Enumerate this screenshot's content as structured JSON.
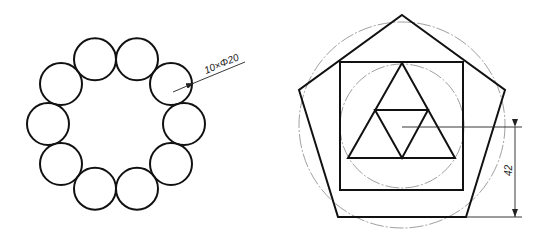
{
  "figure_left": {
    "title": "ring-of-circles",
    "circle_count": 10,
    "circle_radius_px": 21,
    "ring_center": [
      116,
      124
    ],
    "ring_radius_px": 68,
    "annotation": "10×Φ20",
    "leader": {
      "from": [
        173,
        92
      ],
      "to": [
        245,
        62
      ]
    }
  },
  "figure_right": {
    "title": "pentagon-square-triangles",
    "pentagon_points": [
      [
        402,
        15
      ],
      [
        505,
        90
      ],
      [
        466,
        217
      ],
      [
        338,
        217
      ],
      [
        299,
        90
      ]
    ],
    "square": {
      "x": 340,
      "y": 62,
      "w": 123,
      "h": 128
    },
    "outer_centerline_circle": {
      "cx": 402,
      "cy": 125,
      "r": 103
    },
    "inner_centerline_circle": {
      "cx": 402,
      "cy": 126,
      "r": 62
    },
    "outer_triangle": [
      [
        402,
        63
      ],
      [
        455,
        158
      ],
      [
        348,
        158
      ]
    ],
    "inner_triangle": [
      [
        375,
        110
      ],
      [
        428,
        110
      ],
      [
        402,
        158
      ]
    ],
    "dimension": {
      "value": "42",
      "horizontal_ref_line": {
        "x1": 402,
        "x2": 522,
        "y": 127
      },
      "base_ext_line": {
        "x1": 466,
        "x2": 522,
        "y": 217
      },
      "dim_line": {
        "x": 515,
        "y1": 127,
        "y2": 217
      }
    }
  },
  "colors": {
    "line": "#111111",
    "centerline": "#888888",
    "background": "#ffffff"
  }
}
